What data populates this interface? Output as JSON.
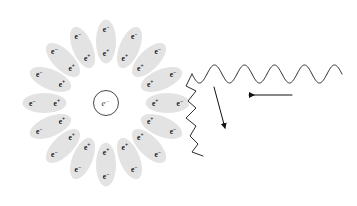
{
  "figure": {
    "background_color": "#ffffff",
    "width": 357,
    "height": 206
  },
  "core": {
    "name": "central-electron",
    "symbol": "e",
    "charge_sign": "−",
    "center_x": 106,
    "center_y": 103,
    "radius": 12.5,
    "stroke_color": "#333333",
    "fill_color": "#ffffff"
  },
  "pair_cloud": {
    "count": 16,
    "angle_step_deg": 22.5,
    "ellipse_fill": "#e3e3e3",
    "label_color": "#141414",
    "outer_symbol": "e",
    "outer_sign": "−",
    "inner_symbol": "e",
    "inner_sign": "+",
    "pairs": [
      {
        "index": 0,
        "angle_deg": 0,
        "cx": 167.5,
        "cy": 103,
        "rx": 22,
        "ry": 10,
        "outer_label": "e",
        "outer_sign": "−",
        "inner_label": "e",
        "inner_sign": "+"
      },
      {
        "index": 1,
        "angle_deg": 22.5,
        "cx": 161.5,
        "cy": 79.5,
        "rx": 22,
        "ry": 10,
        "outer_label": "e",
        "outer_sign": "−",
        "inner_label": "e",
        "inner_sign": "+"
      },
      {
        "index": 2,
        "angle_deg": 45,
        "cx": 149,
        "cy": 60,
        "rx": 22,
        "ry": 10,
        "outer_label": "e",
        "outer_sign": "−",
        "inner_label": "e",
        "inner_sign": "+"
      },
      {
        "index": 3,
        "angle_deg": 67.5,
        "cx": 129.5,
        "cy": 47.5,
        "rx": 22,
        "ry": 10,
        "outer_label": "e",
        "outer_sign": "−",
        "inner_label": "e",
        "inner_sign": "+"
      },
      {
        "index": 4,
        "angle_deg": 90,
        "cx": 106,
        "cy": 41.5,
        "rx": 22,
        "ry": 10,
        "outer_label": "e",
        "outer_sign": "−",
        "inner_label": "e",
        "inner_sign": "+"
      },
      {
        "index": 5,
        "angle_deg": 112.5,
        "cx": 82.5,
        "cy": 47.5,
        "rx": 22,
        "ry": 10,
        "outer_label": "e",
        "outer_sign": "−",
        "inner_label": "e",
        "inner_sign": "+"
      },
      {
        "index": 6,
        "angle_deg": 135,
        "cx": 63,
        "cy": 60,
        "rx": 22,
        "ry": 10,
        "outer_label": "e",
        "outer_sign": "−",
        "inner_label": "e",
        "inner_sign": "+"
      },
      {
        "index": 7,
        "angle_deg": 157.5,
        "cx": 50.5,
        "cy": 79.5,
        "rx": 22,
        "ry": 10,
        "outer_label": "e",
        "outer_sign": "−",
        "inner_label": "e",
        "inner_sign": "+"
      },
      {
        "index": 8,
        "angle_deg": 180,
        "cx": 44.5,
        "cy": 103,
        "rx": 22,
        "ry": 10,
        "outer_label": "e",
        "outer_sign": "−",
        "inner_label": "e",
        "inner_sign": "+"
      },
      {
        "index": 9,
        "angle_deg": 202.5,
        "cx": 50.5,
        "cy": 126.5,
        "rx": 22,
        "ry": 10,
        "outer_label": "e",
        "outer_sign": "−",
        "inner_label": "e",
        "inner_sign": "+"
      },
      {
        "index": 10,
        "angle_deg": 225,
        "cx": 63,
        "cy": 146,
        "rx": 22,
        "ry": 10,
        "outer_label": "e",
        "outer_sign": "−",
        "inner_label": "e",
        "inner_sign": "+"
      },
      {
        "index": 11,
        "angle_deg": 247.5,
        "cx": 82.5,
        "cy": 158.5,
        "rx": 22,
        "ry": 10,
        "outer_label": "e",
        "outer_sign": "−",
        "inner_label": "e",
        "inner_sign": "+"
      },
      {
        "index": 12,
        "angle_deg": 270,
        "cx": 106,
        "cy": 164.5,
        "rx": 22,
        "ry": 10,
        "outer_label": "e",
        "outer_sign": "−",
        "inner_label": "e",
        "inner_sign": "+"
      },
      {
        "index": 13,
        "angle_deg": 292.5,
        "cx": 129.5,
        "cy": 158.5,
        "rx": 22,
        "ry": 10,
        "outer_label": "e",
        "outer_sign": "−",
        "inner_label": "e",
        "inner_sign": "+"
      },
      {
        "index": 14,
        "angle_deg": 315,
        "cx": 149,
        "cy": 146,
        "rx": 22,
        "ry": 10,
        "outer_label": "e",
        "outer_sign": "−",
        "inner_label": "e",
        "inner_sign": "+"
      },
      {
        "index": 15,
        "angle_deg": 337.5,
        "cx": 161.5,
        "cy": 126.5,
        "rx": 22,
        "ry": 10,
        "outer_label": "e",
        "outer_sign": "−",
        "inner_label": "e",
        "inner_sign": "+"
      }
    ]
  },
  "incident_photon": {
    "name": "incident-photon-wave",
    "description": "smooth sinusoidal wave entering from the right",
    "start_x": 342,
    "end_x": 192,
    "baseline_y": 74,
    "amplitude": 9,
    "cycles": 5,
    "stroke_color": "#2b2b2b"
  },
  "scattered_photon": {
    "name": "scattered-photon-wave",
    "description": "irregular wave leaving downward to the lower left",
    "stroke_color": "#2b2b2b",
    "path": "M 192 74 L 186 86 L 196 91 L 188 101 L 196 108 L 186 118 L 196 126 L 190 136 L 198 144 L 192 152 L 203 156"
  },
  "arrows": [
    {
      "name": "incident-direction-arrow",
      "description": "straight arrow pointing left showing incoming photon direction",
      "x1": 292,
      "y1": 95,
      "x2": 249,
      "y2": 95,
      "color": "#111111"
    },
    {
      "name": "scattered-direction-arrow",
      "description": "diagonal arrow pointing down-right toward the scattered wave",
      "x1": 214,
      "y1": 87,
      "x2": 225,
      "y2": 128,
      "color": "#111111"
    }
  ]
}
